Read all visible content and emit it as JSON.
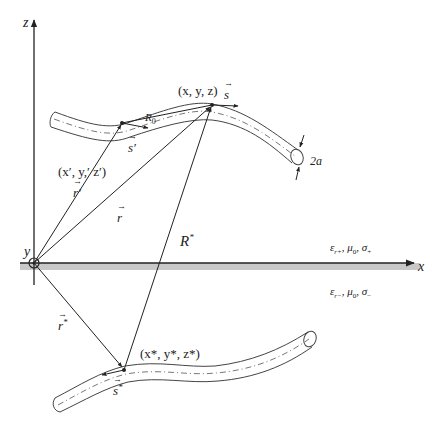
{
  "diagram": {
    "axes": {
      "z": "z",
      "x": "x",
      "y": "y"
    },
    "upper_wire": {
      "point": "(x, y, z)",
      "point_prime": "(x′, y,′ z′)",
      "R0": "R",
      "R0_sub": "0",
      "s_vec": "s",
      "s_prime_vec": "s′",
      "radius": "2a"
    },
    "vectors": {
      "r_prime": "r′",
      "r": "r",
      "R_star": "R",
      "R_star_sup": "*",
      "r_star": "r",
      "r_star_sup": "*"
    },
    "image_wire": {
      "point": "(x*, y*, z*)",
      "s_star": "s",
      "s_star_sup": "*"
    },
    "media": {
      "upper": "ε",
      "upper_rest": "r+, μ0, σ+",
      "upper_eps_sub": "r+",
      "upper_mu": "μ",
      "upper_mu_sub": "0",
      "upper_sigma": "σ",
      "upper_sigma_sub": "+",
      "lower": "ε",
      "lower_eps_sub": "r−",
      "lower_mu": "μ",
      "lower_mu_sub": "0",
      "lower_sigma": "σ",
      "lower_sigma_sub": "−"
    },
    "caption": ""
  },
  "colors": {
    "line": "#222222",
    "ground": "#bdbdbd",
    "wire_outline": "#444444"
  }
}
